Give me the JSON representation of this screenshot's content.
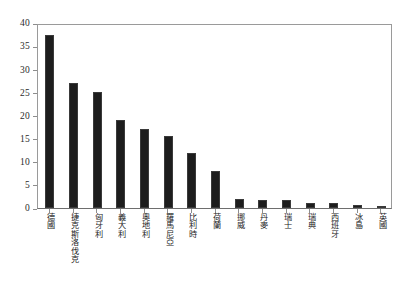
{
  "chart_data": {
    "type": "bar",
    "title": "",
    "subtitle": "",
    "xlabel": "",
    "ylabel": "",
    "ylim": [
      0,
      40
    ],
    "yticks": [
      0,
      5,
      10,
      15,
      20,
      25,
      30,
      35,
      40
    ],
    "grid": false,
    "legend": null,
    "bar_color": "#1d1d1d",
    "axis_color": "#8d8d8d",
    "categories": [
      "德國",
      "捷克斯洛伐克",
      "匈牙利",
      "義大利",
      "奧地利",
      "羅馬尼亞",
      "比利時",
      "荷蘭",
      "挪威",
      "丹麥",
      "瑞士",
      "瑞典",
      "西班牙",
      "冰島",
      "英國"
    ],
    "values": [
      37.5,
      27,
      25,
      19,
      17,
      15.5,
      11.8,
      8,
      2,
      1.8,
      1.7,
      1,
      1,
      0.7,
      0.5
    ]
  }
}
